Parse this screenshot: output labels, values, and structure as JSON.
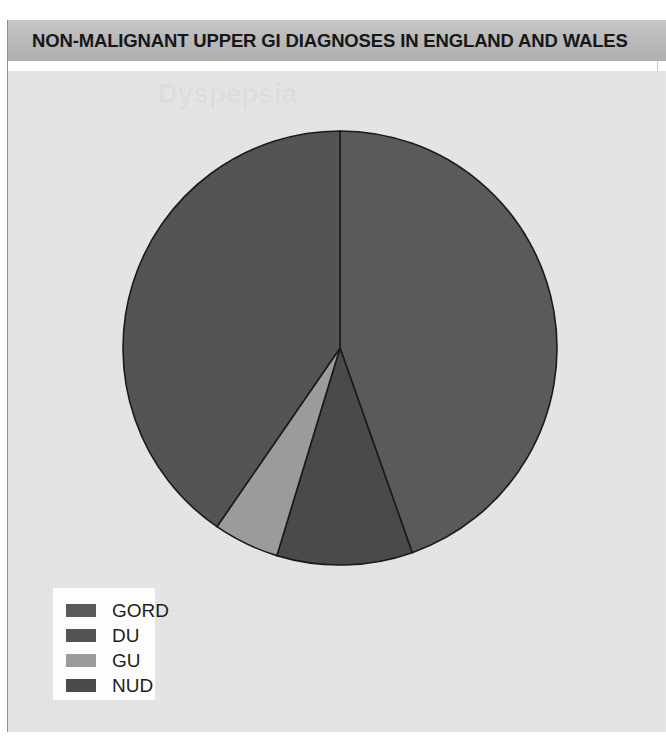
{
  "header": {
    "title": "NON-MALIGNANT UPPER GI DIAGNOSES IN ENGLAND AND WALES"
  },
  "ghost": {
    "text": "Dyspepsia"
  },
  "legend": {
    "items": [
      {
        "label": "GORD",
        "color": "#5a5a5a"
      },
      {
        "label": "DU",
        "color": "#545454"
      },
      {
        "label": "GU",
        "color": "#9b9b9b"
      },
      {
        "label": "NUD",
        "color": "#4a4a4a"
      }
    ]
  },
  "chart_data": {
    "type": "pie",
    "title": "NON-MALIGNANT UPPER GI DIAGNOSES IN ENGLAND AND WALES",
    "labels": [
      "GORD",
      "NUD",
      "GU",
      "DU"
    ],
    "values": [
      44.6,
      10.1,
      4.9,
      40.4
    ],
    "colors": [
      "#5a5a5a",
      "#4a4a4a",
      "#9b9b9b",
      "#545454"
    ],
    "units": "percent",
    "start_angle_deg": 0,
    "direction": "clockwise",
    "legend_order": [
      "GORD",
      "DU",
      "GU",
      "NUD"
    ],
    "legend_position": "bottom-left",
    "grid": false,
    "xlabel": "",
    "ylabel": "",
    "stroke_color": "#1a1a1a",
    "center_px": [
      340,
      348
    ],
    "radius_px": 217
  }
}
